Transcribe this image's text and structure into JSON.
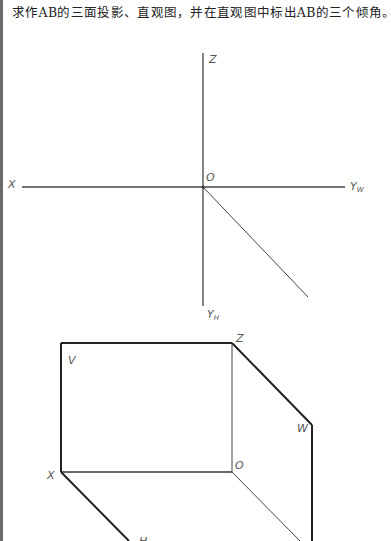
{
  "title": "求作AB的三面投影、直观图，并在直观图中标出AB的三个倾角。",
  "projection_axes": {
    "labels": {
      "z": "Z",
      "o": "O",
      "x": "X",
      "yw_main": "Y",
      "yw_sub": "W",
      "yh_main": "Y",
      "yh_sub": "H"
    }
  },
  "perspective_view": {
    "labels": {
      "z": "Z",
      "v": "V",
      "w": "W",
      "x": "X",
      "o": "O",
      "h": "H"
    }
  },
  "colors": {
    "line": "#333333",
    "label": "#555555",
    "border": "#6a6a6a"
  }
}
